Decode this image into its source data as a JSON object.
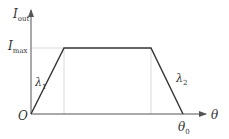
{
  "diagram": {
    "type": "trapezoidal-profile",
    "y_axis_label": "I",
    "y_axis_sub": "out",
    "x_axis_label": "θ",
    "origin_label": "O",
    "imax_label": "I",
    "imax_sub": "max",
    "slope1_label": "λ",
    "slope1_sub": "1",
    "slope2_label": "λ",
    "slope2_sub": "2",
    "theta0_label": "θ",
    "theta0_sub": "0",
    "colors": {
      "curve": "#333333",
      "axis": "#555555",
      "guide": "#cccccc"
    },
    "points": [
      [
        0,
        0
      ],
      [
        0.21,
        1
      ],
      [
        0.79,
        1
      ],
      [
        1,
        0
      ]
    ]
  }
}
